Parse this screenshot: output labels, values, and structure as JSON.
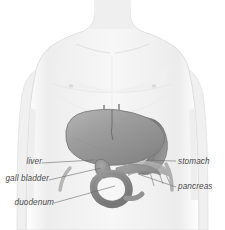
{
  "figure": {
    "view": "anterior",
    "background_color": "#ffffff",
    "body_fill": "#f2f2f2",
    "body_stroke": "#d8d8d8",
    "leader_line_color": "#6b6b6b",
    "label_color": "#4a4a4a"
  },
  "labels": [
    {
      "id": "liver",
      "text": "liver",
      "side": "left",
      "x": 4,
      "y": 158,
      "width": 38,
      "leader": {
        "x1": 42,
        "y1": 163,
        "x2": 94,
        "y2": 160
      },
      "organ_color": "#9a9a9a"
    },
    {
      "id": "gall-bladder",
      "text": "gall bladder",
      "side": "left",
      "x": 1,
      "y": 175,
      "width": 46,
      "leader": {
        "x1": 49,
        "y1": 180,
        "x2": 101,
        "y2": 168
      },
      "organ_color": "#8e8e8e"
    },
    {
      "id": "duodenum",
      "text": "duodenum",
      "side": "left",
      "x": 4,
      "y": 200,
      "width": 47,
      "leader": {
        "x1": 54,
        "y1": 203,
        "x2": 115,
        "y2": 186
      },
      "organ_color": "#8a8a8a"
    },
    {
      "id": "stomach",
      "text": "stomach",
      "side": "right",
      "x": 178,
      "y": 158,
      "width": 40,
      "leader": {
        "x1": 176,
        "y1": 161,
        "x2": 142,
        "y2": 160
      },
      "organ_color": "#808080"
    },
    {
      "id": "pancreas",
      "text": "pancreas",
      "side": "right",
      "x": 178,
      "y": 183,
      "width": 42,
      "leader": {
        "x1": 176,
        "y1": 187,
        "x2": 138,
        "y2": 174
      },
      "organ_color": "#909090"
    }
  ],
  "organs": [
    {
      "id": "liver",
      "name": "liver",
      "shade": "#9a9a9a"
    },
    {
      "id": "stomach",
      "name": "stomach",
      "shade": "#808080"
    },
    {
      "id": "duodenum",
      "name": "duodenum",
      "shade": "#8a8a8a"
    },
    {
      "id": "gall-bladder",
      "name": "gall bladder",
      "shade": "#8e8e8e"
    },
    {
      "id": "pancreas",
      "name": "pancreas",
      "shade": "#909090"
    }
  ]
}
